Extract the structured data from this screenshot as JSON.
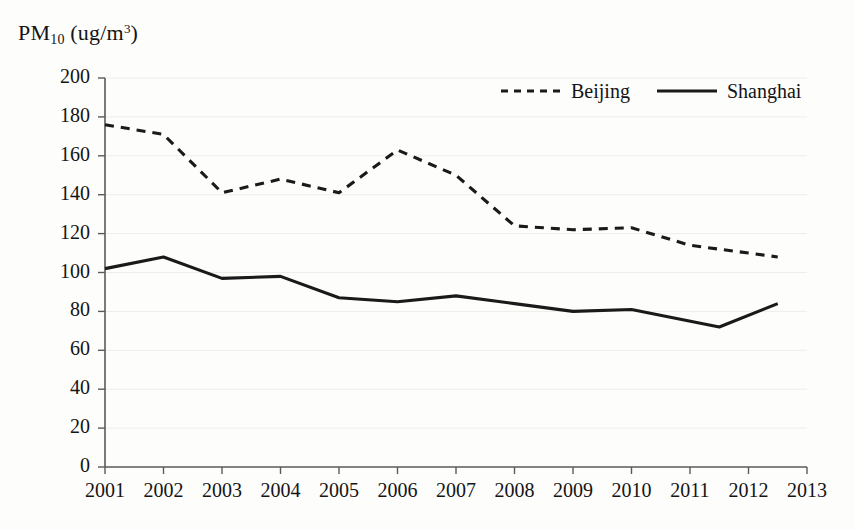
{
  "chart_data": {
    "type": "line",
    "title": "",
    "subtitle": "",
    "xlabel": "",
    "ylabel": "PM10 (ug/m3)",
    "ylabel_base": "PM",
    "ylabel_sub": "10",
    "ylabel_unit_open": " (ug/m",
    "ylabel_sup": "3",
    "ylabel_unit_close": ")",
    "x": [
      2001,
      2002,
      2003,
      2004,
      2005,
      2006,
      2007,
      2008,
      2009,
      2010,
      2011,
      2012
    ],
    "categories": [
      "2001",
      "2002",
      "2003",
      "2004",
      "2005",
      "2006",
      "2007",
      "2008",
      "2009",
      "2010",
      "2011",
      "2012"
    ],
    "xtick_labels": [
      "2001",
      "2002",
      "2003",
      "2004",
      "2005",
      "2006",
      "2007",
      "2008",
      "2009",
      "2010",
      "2011",
      "2012",
      "2013"
    ],
    "xlim": [
      2001,
      2013
    ],
    "ylim": [
      0,
      200
    ],
    "ytick_labels": [
      "200",
      "180",
      "160",
      "140",
      "120",
      "100",
      "80",
      "60",
      "40",
      "20",
      "0"
    ],
    "ytick_values": [
      200,
      180,
      160,
      140,
      120,
      100,
      80,
      60,
      40,
      20,
      0
    ],
    "grid": "horizontal-faint",
    "legend_position": "top-center-right",
    "series": [
      {
        "name": "Beijing",
        "style": "dashed",
        "color": "#1a1a1a",
        "values": [
          176,
          171,
          141,
          148,
          141,
          163,
          150,
          124,
          122,
          123,
          114,
          110,
          108
        ],
        "x": [
          2001,
          2002,
          2003,
          2004,
          2005,
          2006,
          2007,
          2008,
          2009,
          2010,
          2011,
          2012,
          2012.5
        ]
      },
      {
        "name": "Shanghai",
        "style": "solid",
        "color": "#1a1a1a",
        "values": [
          102,
          108,
          97,
          98,
          87,
          85,
          88,
          84,
          80,
          81,
          72,
          84
        ],
        "x": [
          2001,
          2002,
          2003,
          2004,
          2005,
          2006,
          2007,
          2008,
          2009,
          2010,
          2011.5,
          2012.5
        ]
      }
    ]
  },
  "legend": {
    "entries": [
      {
        "label": "Beijing",
        "style": "dashed"
      },
      {
        "label": "Shanghai",
        "style": "solid"
      }
    ]
  },
  "axis": {
    "color": "#5a5a5a",
    "grid_color": "#ededea"
  }
}
